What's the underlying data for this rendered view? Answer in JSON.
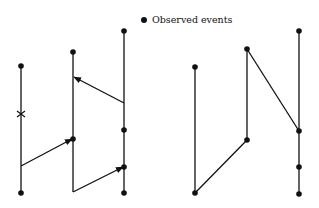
{
  "legend": {
    "label": "Observed events",
    "marker": "filled-circle"
  },
  "colors": {
    "ink": "#111111",
    "background": "#ffffff"
  },
  "diagrams": [
    {
      "name": "left-space-time-diagram",
      "processes": [
        {
          "x": 21,
          "top": 66,
          "bottom": 193,
          "events_y": [
            66,
            193
          ],
          "failure_mark_y": 114
        },
        {
          "x": 73,
          "top": 52,
          "bottom": 192,
          "events_y": [
            52,
            139
          ]
        },
        {
          "x": 124,
          "top": 31,
          "bottom": 193,
          "events_y": [
            31,
            130,
            167,
            193
          ]
        }
      ],
      "messages": [
        {
          "from": [
            21,
            166
          ],
          "to": [
            72,
            139
          ],
          "arrow": true
        },
        {
          "from": [
            73,
            192
          ],
          "to": [
            123,
            167
          ],
          "arrow": true
        },
        {
          "from": [
            124,
            103
          ],
          "to": [
            74,
            77
          ],
          "arrow": true
        }
      ]
    },
    {
      "name": "right-observed-path-diagram",
      "processes": [
        {
          "x": 195,
          "top": 67,
          "bottom": 193,
          "events_y": [
            67,
            193
          ]
        },
        {
          "x": 247,
          "top": 49,
          "bottom": 140,
          "events_y": [
            49,
            140
          ]
        },
        {
          "x": 299,
          "top": 31,
          "bottom": 194,
          "events_y": [
            31,
            131,
            167,
            194
          ]
        }
      ],
      "messages": [
        {
          "from": [
            195,
            193
          ],
          "to": [
            247,
            140
          ],
          "arrow": false
        },
        {
          "from": [
            247,
            49
          ],
          "to": [
            299,
            131
          ],
          "arrow": false
        }
      ]
    }
  ]
}
